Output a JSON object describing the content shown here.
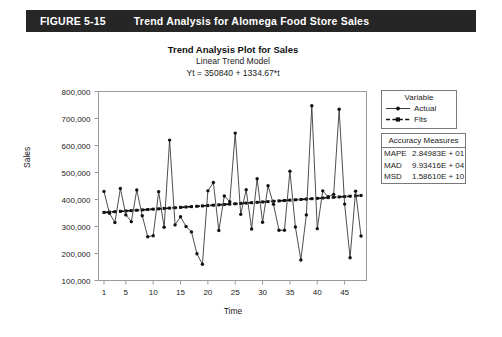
{
  "figure": {
    "number": "FIGURE 5-15",
    "title": "Trend Analysis for Alomega Food Store Sales",
    "banner_color": "#262626",
    "banner_text_color": "#ffffff"
  },
  "chart_titles": {
    "main": "Trend Analysis Plot for Sales",
    "sub": "Linear Trend Model",
    "equation": "Yt = 350840 + 1334.67*t"
  },
  "legend": {
    "header": "Variable",
    "items": [
      {
        "label": "Actual",
        "style": "solid-line-with-marker"
      },
      {
        "label": "Fits",
        "style": "dashed-line-with-marker"
      }
    ]
  },
  "accuracy": {
    "header": "Accuracy Measures",
    "rows": [
      {
        "name": "MAPE",
        "value": "2.84983E + 01"
      },
      {
        "name": "MAD",
        "value": "9.93416E + 04"
      },
      {
        "name": "MSD",
        "value": "1.58610E + 10"
      }
    ]
  },
  "chart_data": {
    "type": "line",
    "title": "Trend Analysis Plot for Sales",
    "subtitle": "Linear Trend Model",
    "annotation": "Yt = 350840 + 1334.67*t",
    "xlabel": "Time",
    "ylabel": "Sales",
    "xlim": [
      0,
      49
    ],
    "ylim": [
      100000,
      800000
    ],
    "xticks": [
      1,
      5,
      10,
      15,
      20,
      25,
      30,
      35,
      40,
      45
    ],
    "ytick_labels": [
      "100,000",
      "200,000",
      "300,000",
      "400,000",
      "500,000",
      "600,000",
      "700,000",
      "800,000"
    ],
    "yticks": [
      100000,
      200000,
      300000,
      400000,
      500000,
      600000,
      700000,
      800000
    ],
    "grid": false,
    "legend_position": "right",
    "x": [
      1,
      2,
      3,
      4,
      5,
      6,
      7,
      8,
      9,
      10,
      11,
      12,
      13,
      14,
      15,
      16,
      17,
      18,
      19,
      20,
      21,
      22,
      23,
      24,
      25,
      26,
      27,
      28,
      29,
      30,
      31,
      32,
      33,
      34,
      35,
      36,
      37,
      38,
      39,
      40,
      41,
      42,
      43,
      44,
      45,
      46,
      47,
      48
    ],
    "series": [
      {
        "name": "Actual",
        "line": "solid",
        "marker": "filled-circle",
        "values": [
          430000,
          349000,
          315000,
          441000,
          343000,
          318000,
          435000,
          340000,
          262000,
          266000,
          429000,
          297000,
          620000,
          306000,
          336000,
          300000,
          280000,
          199000,
          160000,
          432000,
          463000,
          285000,
          413000,
          392000,
          646000,
          345000,
          436000,
          291000,
          477000,
          316000,
          451000,
          382000,
          286000,
          286000,
          505000,
          298000,
          176000,
          343000,
          747000,
          292000,
          432000,
          410000,
          419000,
          734000,
          383000,
          184000,
          431000,
          265000
        ]
      },
      {
        "name": "Fits",
        "line": "dashed",
        "marker": "filled-square",
        "values": [
          352175,
          353509,
          354844,
          356179,
          357513,
          358848,
          360183,
          361517,
          362852,
          364187,
          365521,
          366856,
          368191,
          369525,
          370860,
          372195,
          373529,
          374864,
          376199,
          377533,
          378868,
          380203,
          381537,
          382872,
          384207,
          385541,
          386876,
          388211,
          389545,
          390880,
          392215,
          393549,
          394884,
          396219,
          397553,
          398888,
          400223,
          401557,
          402892,
          404227,
          405561,
          406896,
          408231,
          409565,
          410900,
          412235,
          413569,
          414904
        ]
      }
    ]
  }
}
